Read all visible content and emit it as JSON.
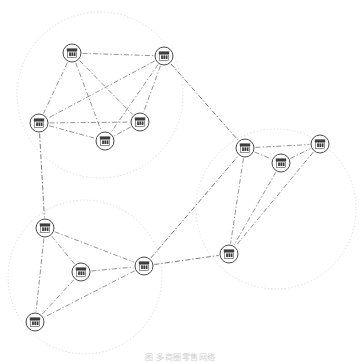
{
  "figure": {
    "caption": "图         多商圈零售网络",
    "background_color": "#ffffff",
    "node_icon": "store-icon",
    "node_stroke_color": "#4a4a4a",
    "edge_color": "#7a7a7a",
    "cluster_ring_color": "#c9c9c9",
    "node_radius": 9,
    "node_count": 13,
    "cluster_count": 3,
    "edge_count": 26
  },
  "chart_data": {
    "type": "diagram",
    "title": "",
    "clusters": [
      {
        "id": "cluster-top-left",
        "label": "",
        "cx": 100,
        "cy": 95,
        "r": 83
      },
      {
        "id": "cluster-right",
        "label": "",
        "cx": 276,
        "cy": 209,
        "r": 80
      },
      {
        "id": "cluster-bottom-left",
        "label": "",
        "cx": 85,
        "cy": 277,
        "r": 77
      }
    ],
    "nodes": [
      {
        "id": "n1",
        "label": "",
        "cluster": "cluster-top-left",
        "x": 72,
        "y": 53
      },
      {
        "id": "n2",
        "label": "",
        "cluster": "cluster-top-left",
        "x": 164,
        "y": 56
      },
      {
        "id": "n3",
        "label": "",
        "cluster": "cluster-top-left",
        "x": 39,
        "y": 123
      },
      {
        "id": "n4",
        "label": "",
        "cluster": "cluster-top-left",
        "x": 140,
        "y": 122
      },
      {
        "id": "n5",
        "label": "",
        "cluster": "cluster-top-left",
        "x": 105,
        "y": 141
      },
      {
        "id": "n6",
        "label": "",
        "cluster": "cluster-right",
        "x": 245,
        "y": 148
      },
      {
        "id": "n7",
        "label": "",
        "cluster": "cluster-right",
        "x": 281,
        "y": 163
      },
      {
        "id": "n8",
        "label": "",
        "cluster": "cluster-right",
        "x": 320,
        "y": 144
      },
      {
        "id": "n9",
        "label": "",
        "cluster": "cluster-right",
        "x": 229,
        "y": 254
      },
      {
        "id": "n10",
        "label": "",
        "cluster": "cluster-bottom-left",
        "x": 45,
        "y": 228
      },
      {
        "id": "n11",
        "label": "",
        "cluster": "cluster-bottom-left",
        "x": 81,
        "y": 272
      },
      {
        "id": "n12",
        "label": "",
        "cluster": "cluster-bottom-left",
        "x": 144,
        "y": 266
      },
      {
        "id": "n13",
        "label": "",
        "cluster": "cluster-bottom-left",
        "x": 35,
        "y": 322
      }
    ],
    "edges": [
      {
        "source": "n1",
        "target": "n2",
        "type": "intra"
      },
      {
        "source": "n1",
        "target": "n3",
        "type": "intra"
      },
      {
        "source": "n1",
        "target": "n4",
        "type": "intra"
      },
      {
        "source": "n1",
        "target": "n5",
        "type": "intra"
      },
      {
        "source": "n2",
        "target": "n3",
        "type": "intra"
      },
      {
        "source": "n2",
        "target": "n4",
        "type": "intra"
      },
      {
        "source": "n2",
        "target": "n5",
        "type": "intra"
      },
      {
        "source": "n3",
        "target": "n4",
        "type": "intra"
      },
      {
        "source": "n3",
        "target": "n5",
        "type": "intra"
      },
      {
        "source": "n4",
        "target": "n5",
        "type": "intra"
      },
      {
        "source": "n6",
        "target": "n7",
        "type": "intra"
      },
      {
        "source": "n6",
        "target": "n8",
        "type": "intra"
      },
      {
        "source": "n6",
        "target": "n9",
        "type": "intra"
      },
      {
        "source": "n7",
        "target": "n8",
        "type": "intra"
      },
      {
        "source": "n7",
        "target": "n9",
        "type": "intra"
      },
      {
        "source": "n8",
        "target": "n9",
        "type": "intra"
      },
      {
        "source": "n10",
        "target": "n11",
        "type": "intra"
      },
      {
        "source": "n10",
        "target": "n12",
        "type": "intra"
      },
      {
        "source": "n10",
        "target": "n13",
        "type": "intra"
      },
      {
        "source": "n11",
        "target": "n12",
        "type": "intra"
      },
      {
        "source": "n11",
        "target": "n13",
        "type": "intra"
      },
      {
        "source": "n12",
        "target": "n13",
        "type": "intra"
      },
      {
        "source": "n2",
        "target": "n6",
        "type": "inter"
      },
      {
        "source": "n3",
        "target": "n10",
        "type": "inter"
      },
      {
        "source": "n12",
        "target": "n6",
        "type": "inter"
      },
      {
        "source": "n12",
        "target": "n9",
        "type": "inter"
      }
    ]
  }
}
